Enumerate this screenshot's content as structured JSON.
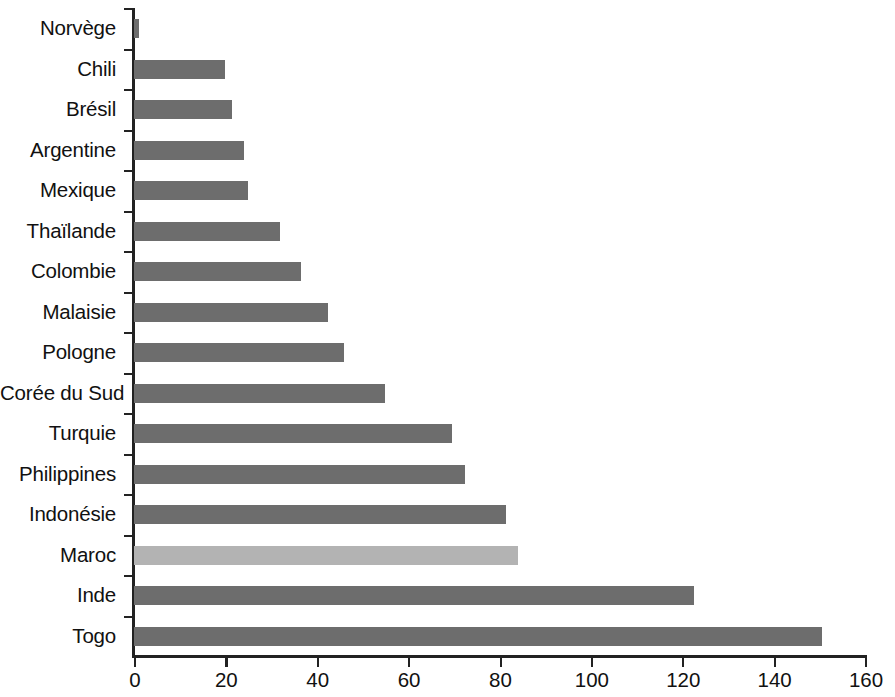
{
  "chart_data": {
    "type": "bar",
    "orientation": "horizontal",
    "title": "",
    "subtitle": "",
    "xlabel": "",
    "ylabel": "",
    "xlim": [
      0,
      160
    ],
    "xticks": [
      0,
      20,
      40,
      60,
      80,
      100,
      120,
      140,
      160
    ],
    "xtick_labels": [
      "0",
      "20",
      "40",
      "60",
      "80",
      "100",
      "120",
      "140",
      "160"
    ],
    "grid": false,
    "legend": null,
    "categories": [
      "Norvège",
      "Chili",
      "Brésil",
      "Argentine",
      "Mexique",
      "Thaïlande",
      "Colombie",
      "Malaisie",
      "Pologne",
      "Corée du Sud",
      "Turquie",
      "Philippines",
      "Indonésie",
      "Maroc",
      "Inde",
      "Togo"
    ],
    "values": [
      1,
      20,
      21.5,
      24,
      25,
      32,
      36.5,
      42.5,
      46,
      55,
      69.5,
      72.5,
      81.5,
      84,
      122.5,
      150.5
    ],
    "highlight_category": "Maroc",
    "colors": {
      "bar": "#6d6d6d",
      "bar_highlight": "#b3b3b3",
      "axis": "#222222",
      "text": "#111111",
      "background": "#ffffff"
    }
  }
}
